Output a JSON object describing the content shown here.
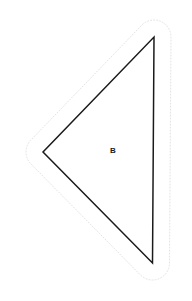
{
  "canvas": {
    "width": 192,
    "height": 301,
    "background": "#ffffff"
  },
  "figure": {
    "name": "triangle-shape-b",
    "label": "B",
    "label_position": {
      "x": 113,
      "y": 151
    },
    "label_color": "#1a1a1a",
    "shape": {
      "type": "triangle",
      "fill": "#ffffff",
      "stroke": "#1a1a1a",
      "stroke_width": 1.5,
      "vertices": [
        {
          "x": 154,
          "y": 37
        },
        {
          "x": 152.5,
          "y": 263
        },
        {
          "x": 43,
          "y": 152
        }
      ]
    },
    "outline": {
      "type": "offset-outline",
      "style": "dotted",
      "stroke": "#e3e3e3",
      "stroke_width": 1,
      "dash_pattern": "1 2",
      "offset": 17,
      "corner_radius": 17,
      "path": "M 170.5 54 L 170.5 246 A 17 17 0 0 1 160.8 277.2 A 17 17 0 0 1 142.3 274.0 L 19.1 164.4 A 17 17 0 0 1 19.0 139.1 L 141.0 25.6 A 17 17 0 0 1 170.5 37.2 Z"
    }
  }
}
